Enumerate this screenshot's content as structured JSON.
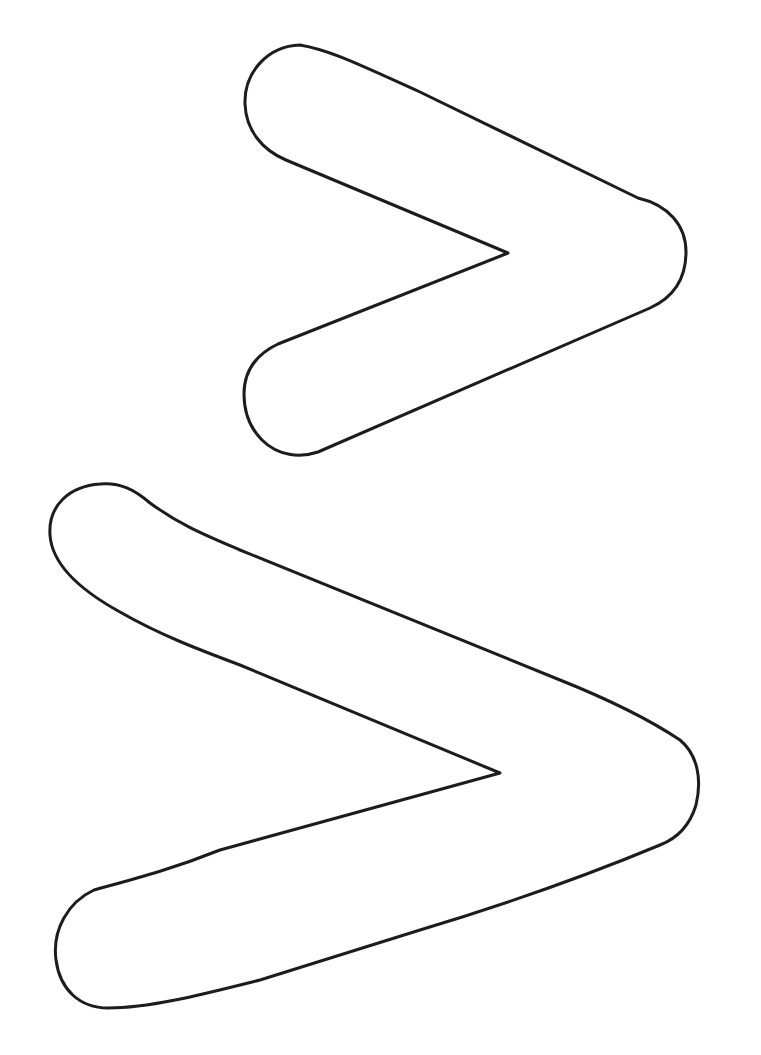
{
  "page": {
    "background": "#ffffff",
    "stroke_color": "#1c1c1c"
  },
  "shapes": [
    {
      "name": "small-chevron",
      "glyph": ">"
    },
    {
      "name": "large-chevron",
      "glyph": ">"
    }
  ]
}
